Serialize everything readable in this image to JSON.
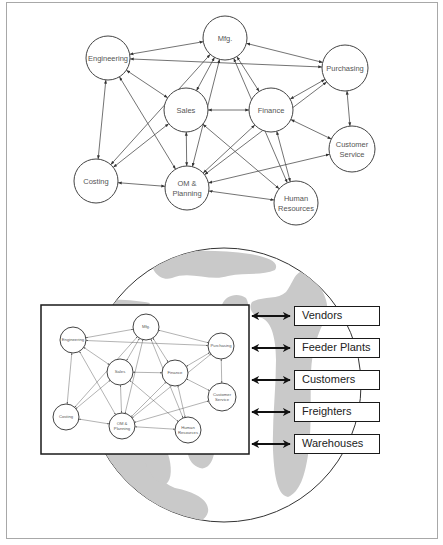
{
  "top_diagram": {
    "nodes": [
      {
        "id": "engineering",
        "label": [
          "Engineering"
        ],
        "x": 108,
        "y": 58,
        "r": 22
      },
      {
        "id": "mfg",
        "label": [
          "Mfg."
        ],
        "x": 225,
        "y": 38,
        "r": 22
      },
      {
        "id": "purchasing",
        "label": [
          "Purchasing"
        ],
        "x": 345,
        "y": 68,
        "r": 23
      },
      {
        "id": "sales",
        "label": [
          "Sales"
        ],
        "x": 186,
        "y": 110,
        "r": 22
      },
      {
        "id": "finance",
        "label": [
          "Finance"
        ],
        "x": 271,
        "y": 110,
        "r": 22
      },
      {
        "id": "customer_service",
        "label": [
          "Customer",
          "Service"
        ],
        "x": 352,
        "y": 149,
        "r": 23
      },
      {
        "id": "costing",
        "label": [
          "Costing"
        ],
        "x": 96,
        "y": 181,
        "r": 22
      },
      {
        "id": "om_planning",
        "label": [
          "OM &",
          "Planning"
        ],
        "x": 187,
        "y": 188,
        "r": 22
      },
      {
        "id": "human_resources",
        "label": [
          "Human",
          "Resources"
        ],
        "x": 296,
        "y": 203,
        "r": 22
      }
    ],
    "edges": [
      [
        "engineering",
        "mfg"
      ],
      [
        "engineering",
        "purchasing"
      ],
      [
        "engineering",
        "sales"
      ],
      [
        "engineering",
        "costing"
      ],
      [
        "engineering",
        "om_planning"
      ],
      [
        "mfg",
        "purchasing"
      ],
      [
        "mfg",
        "sales"
      ],
      [
        "mfg",
        "finance"
      ],
      [
        "mfg",
        "costing"
      ],
      [
        "mfg",
        "om_planning"
      ],
      [
        "mfg",
        "human_resources"
      ],
      [
        "purchasing",
        "finance"
      ],
      [
        "purchasing",
        "customer_service"
      ],
      [
        "purchasing",
        "om_planning"
      ],
      [
        "sales",
        "finance"
      ],
      [
        "sales",
        "om_planning"
      ],
      [
        "sales",
        "costing"
      ],
      [
        "sales",
        "human_resources"
      ],
      [
        "finance",
        "customer_service"
      ],
      [
        "finance",
        "om_planning"
      ],
      [
        "finance",
        "human_resources"
      ],
      [
        "customer_service",
        "om_planning"
      ],
      [
        "costing",
        "om_planning"
      ],
      [
        "om_planning",
        "human_resources"
      ]
    ]
  },
  "inner_diagram": {
    "box": {
      "x": 41,
      "y": 305,
      "w": 208,
      "h": 149
    },
    "nodes": [
      {
        "id": "engineering",
        "label": [
          "Engineering"
        ],
        "x": 73,
        "y": 340,
        "r": 13
      },
      {
        "id": "mfg",
        "label": [
          "Mfg."
        ],
        "x": 146,
        "y": 327,
        "r": 13
      },
      {
        "id": "purchasing",
        "label": [
          "Purchasing"
        ],
        "x": 221,
        "y": 346,
        "r": 13
      },
      {
        "id": "sales",
        "label": [
          "Sales"
        ],
        "x": 120,
        "y": 372,
        "r": 13
      },
      {
        "id": "finance",
        "label": [
          "Finance"
        ],
        "x": 175,
        "y": 373,
        "r": 13
      },
      {
        "id": "customer_service",
        "label": [
          "Customer",
          "Service"
        ],
        "x": 222,
        "y": 397,
        "r": 14
      },
      {
        "id": "costing",
        "label": [
          "Costing"
        ],
        "x": 66,
        "y": 417,
        "r": 13
      },
      {
        "id": "om_planning",
        "label": [
          "OM &",
          "Planning"
        ],
        "x": 122,
        "y": 426,
        "r": 13
      },
      {
        "id": "human_resources",
        "label": [
          "Human",
          "Resources"
        ],
        "x": 188,
        "y": 430,
        "r": 13
      }
    ]
  },
  "globe": {
    "cx": 224,
    "cy": 385,
    "r": 137
  },
  "external_partners": [
    {
      "label": "Vendors",
      "y": 306
    },
    {
      "label": "Feeder Plants",
      "y": 338
    },
    {
      "label": "Customers",
      "y": 370
    },
    {
      "label": "Freighters",
      "y": 402
    },
    {
      "label": "Warehouses",
      "y": 434
    }
  ],
  "colors": {
    "line": "#444444",
    "land": "#c9c9c9",
    "frame": "#a8a8a8"
  }
}
